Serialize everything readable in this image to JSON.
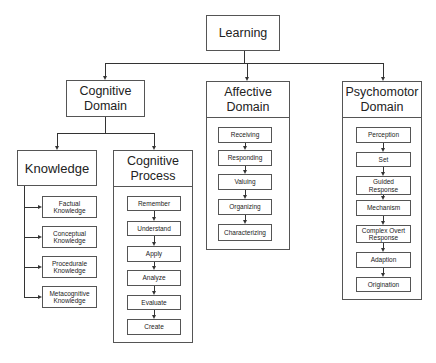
{
  "root": {
    "label": "Learning"
  },
  "domains": [
    {
      "label": "Cognitive Domain",
      "children": [
        {
          "label": "Knowledge",
          "items": [
            "Factual Knowledge",
            "Conceptual Knowledge",
            "Procedurale Knowledge",
            "Metacognitive Knowledge"
          ]
        },
        {
          "label": "Cognitive Process",
          "items": [
            "Remember",
            "Understand",
            "Apply",
            "Analyze",
            "Evaluate",
            "Create"
          ]
        }
      ]
    },
    {
      "label": "Affective Domain",
      "items": [
        "Receiving",
        "Responding",
        "Valuing",
        "Organizing",
        "Characterizing"
      ]
    },
    {
      "label": "Psychomotor Domain",
      "items": [
        "Perception",
        "Set",
        "Guided Response",
        "Mechanism",
        "Complex Overt Response",
        "Adaption",
        "Origination"
      ]
    }
  ]
}
